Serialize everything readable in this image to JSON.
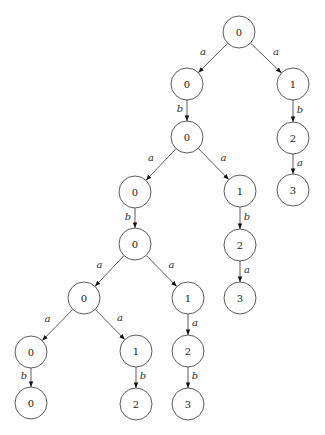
{
  "diagram": {
    "type": "tree",
    "node_radius": 16,
    "colors": {
      "stroke": "#333333",
      "fill": "#ffffff",
      "text": "#222222"
    },
    "nodes": [
      {
        "id": "n1",
        "label": "0",
        "x": 239,
        "y": 32
      },
      {
        "id": "n2",
        "label": "0",
        "x": 187,
        "y": 84
      },
      {
        "id": "n3",
        "label": "1",
        "x": 293,
        "y": 84
      },
      {
        "id": "n4",
        "label": "0",
        "x": 187,
        "y": 137
      },
      {
        "id": "n5",
        "label": "2",
        "x": 293,
        "y": 138
      },
      {
        "id": "n6",
        "label": "3",
        "x": 293,
        "y": 190
      },
      {
        "id": "n7",
        "label": "0",
        "x": 135,
        "y": 192
      },
      {
        "id": "n8",
        "label": "1",
        "x": 240,
        "y": 191
      },
      {
        "id": "n9",
        "label": "0",
        "x": 135,
        "y": 244
      },
      {
        "id": "n10",
        "label": "2",
        "x": 240,
        "y": 245
      },
      {
        "id": "n11",
        "label": "3",
        "x": 240,
        "y": 298
      },
      {
        "id": "n12",
        "label": "0",
        "x": 84,
        "y": 298
      },
      {
        "id": "n13",
        "label": "1",
        "x": 188,
        "y": 298
      },
      {
        "id": "n14",
        "label": "0",
        "x": 31,
        "y": 352
      },
      {
        "id": "n15",
        "label": "1",
        "x": 136,
        "y": 351
      },
      {
        "id": "n16",
        "label": "2",
        "x": 188,
        "y": 351
      },
      {
        "id": "n17",
        "label": "0",
        "x": 31,
        "y": 403
      },
      {
        "id": "n18",
        "label": "2",
        "x": 136,
        "y": 404
      },
      {
        "id": "n19",
        "label": "3",
        "x": 188,
        "y": 404
      }
    ],
    "edges": [
      {
        "from": "n1",
        "to": "n2",
        "label": "a",
        "side": "left"
      },
      {
        "from": "n1",
        "to": "n3",
        "label": "a",
        "side": "right"
      },
      {
        "from": "n2",
        "to": "n4",
        "label": "b",
        "side": "left"
      },
      {
        "from": "n3",
        "to": "n5",
        "label": "b",
        "side": "right"
      },
      {
        "from": "n5",
        "to": "n6",
        "label": "a",
        "side": "right"
      },
      {
        "from": "n4",
        "to": "n7",
        "label": "a",
        "side": "left"
      },
      {
        "from": "n4",
        "to": "n8",
        "label": "a",
        "side": "right"
      },
      {
        "from": "n7",
        "to": "n9",
        "label": "b",
        "side": "left"
      },
      {
        "from": "n8",
        "to": "n10",
        "label": "b",
        "side": "right"
      },
      {
        "from": "n10",
        "to": "n11",
        "label": "a",
        "side": "right"
      },
      {
        "from": "n9",
        "to": "n12",
        "label": "a",
        "side": "left"
      },
      {
        "from": "n9",
        "to": "n13",
        "label": "a",
        "side": "right"
      },
      {
        "from": "n12",
        "to": "n14",
        "label": "a",
        "side": "left"
      },
      {
        "from": "n12",
        "to": "n15",
        "label": "a",
        "side": "right"
      },
      {
        "from": "n13",
        "to": "n16",
        "label": "a",
        "side": "right"
      },
      {
        "from": "n14",
        "to": "n17",
        "label": "b",
        "side": "left"
      },
      {
        "from": "n15",
        "to": "n18",
        "label": "b",
        "side": "right"
      },
      {
        "from": "n16",
        "to": "n19",
        "label": "b",
        "side": "right"
      }
    ]
  }
}
